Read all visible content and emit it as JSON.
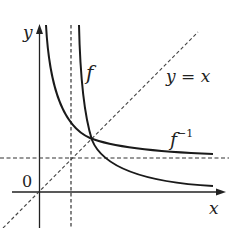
{
  "diagram": {
    "labels": {
      "y_axis": "y",
      "x_axis": "x",
      "origin": "0",
      "f": "f",
      "f_inv_base": "f",
      "f_inv_sup": "−1",
      "identity": "y = x"
    },
    "elements": [
      {
        "type": "axis",
        "name": "x-axis",
        "direction": "horizontal",
        "arrow": true
      },
      {
        "type": "axis",
        "name": "y-axis",
        "direction": "vertical",
        "arrow": true
      },
      {
        "type": "dashed-line",
        "name": "vertical-asymptote"
      },
      {
        "type": "dashed-line",
        "name": "horizontal-asymptote"
      },
      {
        "type": "dashed-line",
        "name": "line-y-equals-x"
      },
      {
        "type": "curve",
        "name": "f",
        "description": "decreasing hyperbola-like curve with vertical asymptote right of y-axis"
      },
      {
        "type": "curve",
        "name": "f-inverse",
        "description": "reflection of f across y = x, with horizontal asymptote above x-axis"
      }
    ],
    "colors": {
      "stroke": "#222222",
      "background": "#ffffff"
    }
  }
}
